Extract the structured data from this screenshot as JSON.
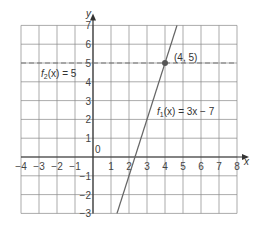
{
  "chart_data": {
    "type": "line",
    "title": "",
    "xlabel": "x",
    "ylabel": "y",
    "xlim": [
      -4,
      8
    ],
    "ylim": [
      -3,
      7
    ],
    "grid": true,
    "x_ticks": [
      "-4",
      "-3",
      "-2",
      "-1",
      "0",
      "1",
      "2",
      "3",
      "4",
      "5",
      "6",
      "7",
      "8"
    ],
    "y_ticks": [
      "-3",
      "-2",
      "-1",
      "1",
      "2",
      "3",
      "4",
      "5",
      "6",
      "7"
    ],
    "series": [
      {
        "name": "f1(x) = 3x − 7",
        "style": "solid",
        "x": [
          1.333,
          4.667
        ],
        "y": [
          -3,
          7
        ]
      },
      {
        "name": "f2(x) = 5",
        "style": "dashed",
        "x": [
          -4,
          8
        ],
        "y": [
          5,
          5
        ]
      }
    ],
    "annotations": [
      {
        "text": "(4, 5)",
        "x": 4,
        "y": 5,
        "marker": "point"
      },
      {
        "text": "f1(x) = 3x − 7"
      },
      {
        "text": "f2(x) = 5"
      }
    ]
  },
  "labels": {
    "x_axis": "x",
    "y_axis": "y",
    "origin": "0",
    "point": "(4, 5)",
    "f1_name": "f",
    "f1_sub": "1",
    "f1_rest": "(x) = 3x − 7",
    "f2_name": "f",
    "f2_sub": "2",
    "f2_rest": "(x) = 5"
  },
  "colors": {
    "grid": "#888888",
    "axis": "#333333",
    "line_f1": "#666666",
    "line_f2": "#777777",
    "point": "#555555"
  }
}
